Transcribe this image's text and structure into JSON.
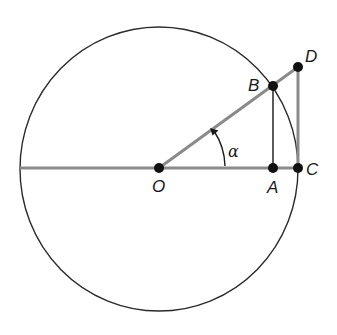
{
  "diagram": {
    "colors": {
      "background": "#ffffff",
      "circle": "#2a2a2a",
      "thick_line": "#8a8a8a",
      "thin_line": "#4a4a4a",
      "point": "#111111",
      "text": "#1a1a1a"
    },
    "circle": {
      "cx": 159,
      "cy": 169,
      "rx": 139,
      "ry": 142
    },
    "points": {
      "O": {
        "label": "O",
        "x": 159,
        "y": 168,
        "label_x": 152,
        "label_y": 192
      },
      "A": {
        "label": "A",
        "x": 273,
        "y": 168,
        "label_x": 267,
        "label_y": 193
      },
      "B": {
        "label": "B",
        "x": 273,
        "y": 86,
        "label_x": 248,
        "label_y": 91
      },
      "C": {
        "label": "C",
        "x": 298,
        "y": 168,
        "label_x": 306,
        "label_y": 175
      },
      "D": {
        "label": "D",
        "x": 298,
        "y": 67,
        "label_x": 305,
        "label_y": 62
      }
    },
    "angle": {
      "symbol": "α",
      "label_x": 228,
      "label_y": 157,
      "vertex": "O"
    },
    "segments": [
      {
        "from": "O",
        "to": "D",
        "name": "ray-od"
      },
      {
        "from": "A",
        "to": "B",
        "name": "segment-ab"
      },
      {
        "from": "C",
        "to": "D",
        "name": "segment-cd"
      }
    ],
    "diameter": {
      "x1": 20,
      "x2": 298,
      "y": 168
    }
  }
}
